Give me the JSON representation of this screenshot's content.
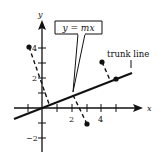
{
  "diagram": {
    "x_axis_label": "x",
    "y_axis_label": "y",
    "x_tick_labels": [
      "2",
      "4"
    ],
    "y_tick_labels": [
      "4",
      "2",
      "−2"
    ],
    "callout": "y = mx",
    "trunk_label": "trunk line",
    "data_points": [
      {
        "x": -1,
        "y": 4
      },
      {
        "x": 3,
        "y": -1
      },
      {
        "x": 4,
        "y": 3
      }
    ],
    "line_color": "#111111"
  }
}
